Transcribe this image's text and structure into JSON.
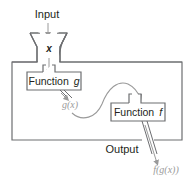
{
  "diagram": {
    "type": "function-composition-machine",
    "input_label": "Input",
    "input_variable": "x",
    "function_g_label": "Function",
    "function_g_name": "g",
    "intermediate_label": "g(x)",
    "function_f_label": "Function",
    "function_f_name": "f",
    "output_label": "Output",
    "output_value": "f(g(x))",
    "colors": {
      "stroke": "#6d6e71",
      "text": "#231f20",
      "secondary_text": "#9a9a9a",
      "background": "#ffffff"
    }
  }
}
